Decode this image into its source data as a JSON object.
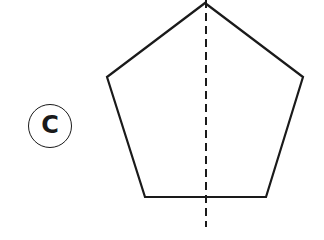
{
  "figure": {
    "option_label": "C",
    "shape": "regular pentagon",
    "shape_vertices": [
      [
        205,
        3
      ],
      [
        303,
        77
      ],
      [
        266,
        197
      ],
      [
        145,
        197
      ],
      [
        107,
        77
      ]
    ],
    "symmetry_line": {
      "style": "dashed",
      "x": 206,
      "y1": 0,
      "y2": 227
    },
    "colors": {
      "stroke": "#1a1a1a",
      "background": "#ffffff"
    }
  }
}
